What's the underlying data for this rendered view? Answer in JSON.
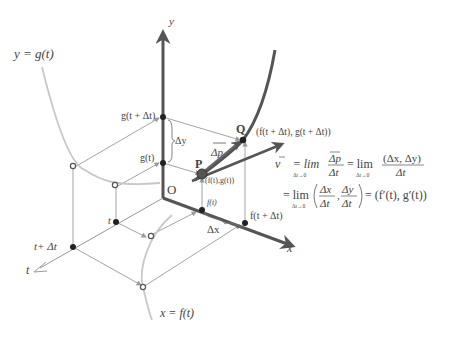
{
  "diagram": {
    "labels": {
      "y_axis": "y",
      "x_axis": "x",
      "t_axis": "t",
      "origin": "O",
      "curve_g": "y = g(t)",
      "curve_f": "x = f(t)",
      "g_t_dt": "g(t + Δt)",
      "g_t": "g(t)",
      "delta_y": "Δy",
      "delta_x": "Δx",
      "f_t": "f(t)",
      "f_t_dt": "f(t + Δt)",
      "t": "t",
      "t_dt": "t+ Δt",
      "point_P": "P",
      "point_P_coords": "(f(t),g(t))",
      "point_Q": "Q",
      "point_Q_coords": "(f(t + Δt), g(t + Δt))",
      "delta_p": "Δp"
    },
    "formula": {
      "line1_lhs": "v⃗ = lim",
      "line1_sub": "Δt→0",
      "line1_frac1_num": "Δp",
      "line1_frac1_den": "Δt",
      "line1_eq2": "= lim",
      "line1_sub2": "Δt→0",
      "line1_frac2_num": "(Δx, Δy)",
      "line1_frac2_den": "Δt",
      "line2_eq": "= lim",
      "line2_sub": "Δt→0",
      "line2_frac1_num": "Δx",
      "line2_frac1_den": "Δt",
      "line2_frac2_num": "Δy",
      "line2_frac2_den": "Δt",
      "line2_result": "= (f′(t), g′(t))"
    },
    "colors": {
      "axis": "#555555",
      "curve_light": "#c8c8c8",
      "curve_dark": "#555555",
      "guide": "#999999",
      "text": "#444444"
    }
  }
}
